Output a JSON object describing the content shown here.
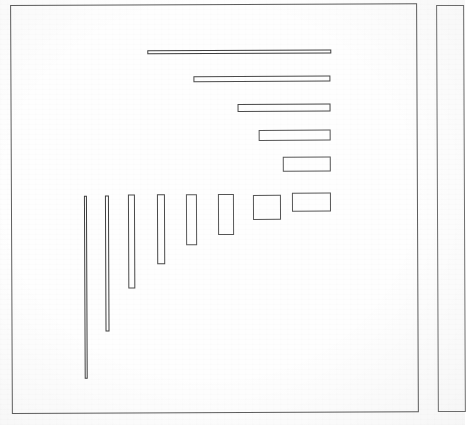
{
  "figure": {
    "type": "line-drawing",
    "background_color": "#fefefe",
    "stroke_color": "#575757"
  },
  "frames": [
    {
      "name": "main-frame",
      "x": 11,
      "y": 4,
      "width": 407,
      "height": 409
    },
    {
      "name": "side-frame",
      "x": 437,
      "y": 6,
      "width": 28,
      "height": 407
    }
  ],
  "chart_data": {
    "type": "bar",
    "title": "",
    "subtitle": "",
    "xlabel": "",
    "ylabel": "",
    "grid": false,
    "legend": null,
    "categories": [
      "r1",
      "r2",
      "r3",
      "r4",
      "r5",
      "r6",
      "r7",
      "r8",
      "r9",
      "r10",
      "r11",
      "r12",
      "r13"
    ],
    "note": "Each datum is a hollow rectangle; values are its pixel width and height within the main frame",
    "rectangles": [
      {
        "id": "r1",
        "label": "horizontal-bar-1",
        "x": 148,
        "y": 50,
        "width": 184,
        "height": 4,
        "orientation": "horizontal"
      },
      {
        "id": "r2",
        "label": "horizontal-bar-2",
        "x": 194,
        "y": 76,
        "width": 137,
        "height": 6,
        "orientation": "horizontal"
      },
      {
        "id": "r3",
        "label": "horizontal-bar-3",
        "x": 238,
        "y": 104,
        "width": 93,
        "height": 8,
        "orientation": "horizontal"
      },
      {
        "id": "r4",
        "label": "horizontal-bar-4",
        "x": 259,
        "y": 130,
        "width": 72,
        "height": 11,
        "orientation": "horizontal"
      },
      {
        "id": "r5",
        "label": "horizontal-bar-5",
        "x": 283,
        "y": 157,
        "width": 48,
        "height": 15,
        "orientation": "horizontal"
      },
      {
        "id": "r6",
        "label": "wide-rect-6",
        "x": 292,
        "y": 193,
        "width": 39,
        "height": 19,
        "orientation": "horizontal"
      },
      {
        "id": "r7",
        "label": "square-7",
        "x": 253,
        "y": 195,
        "width": 28,
        "height": 25,
        "orientation": "square"
      },
      {
        "id": "r8",
        "label": "vertical-rect-8",
        "x": 218,
        "y": 194,
        "width": 16,
        "height": 41,
        "orientation": "vertical"
      },
      {
        "id": "r9",
        "label": "vertical-rect-9",
        "x": 186,
        "y": 194,
        "width": 11,
        "height": 51,
        "orientation": "vertical"
      },
      {
        "id": "r10",
        "label": "vertical-bar-10",
        "x": 157,
        "y": 194,
        "width": 8,
        "height": 70,
        "orientation": "vertical"
      },
      {
        "id": "r11",
        "label": "vertical-bar-11",
        "x": 128,
        "y": 194,
        "width": 7,
        "height": 94,
        "orientation": "vertical"
      },
      {
        "id": "r12",
        "label": "vertical-bar-12",
        "x": 105,
        "y": 195,
        "width": 4,
        "height": 136,
        "orientation": "vertical"
      },
      {
        "id": "r13",
        "label": "vertical-bar-13",
        "x": 84,
        "y": 195,
        "width": 3,
        "height": 183,
        "orientation": "vertical"
      }
    ],
    "widths": [
      184,
      137,
      93,
      72,
      48,
      39,
      28,
      16,
      11,
      8,
      7,
      4,
      3
    ],
    "heights": [
      4,
      6,
      8,
      11,
      15,
      19,
      25,
      41,
      51,
      70,
      94,
      136,
      183
    ]
  }
}
